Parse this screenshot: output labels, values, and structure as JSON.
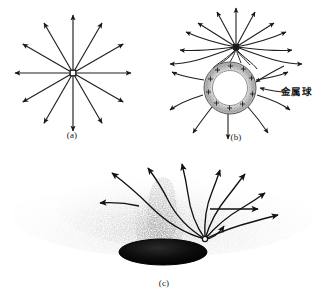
{
  "figure": {
    "panels": [
      {
        "id": "a",
        "caption": "(a)",
        "description": "isolated-point-charge-radial-field",
        "center": [
          73,
          73
        ],
        "ray_count": 12,
        "ray_length": 58,
        "angle_step_deg": 30
      },
      {
        "id": "b",
        "caption": "(b)",
        "description": "point-charge-near-grounded-metal-sphere",
        "charge_point": [
          236,
          47
        ],
        "sphere_center": [
          230,
          88
        ],
        "sphere_radius": 26,
        "label": "金属球",
        "induced_charge_symbol": "+"
      },
      {
        "id": "c",
        "caption": "(c)",
        "description": "field-lines-photograph-from-charged-electrode",
        "source_point": [
          205,
          238
        ],
        "ellipse_center": [
          163,
          252
        ],
        "ellipse_rx": 44,
        "ellipse_ry": 13
      }
    ],
    "colors": {
      "background": "#ffffff",
      "ink": "#1a1a1a",
      "line": "#222222",
      "sphere_fill": "#ffffff",
      "sphere_shade": "#b9b9b9",
      "electrode_fill": "#0a0a0a",
      "smoke": "#7a7a7a"
    }
  }
}
